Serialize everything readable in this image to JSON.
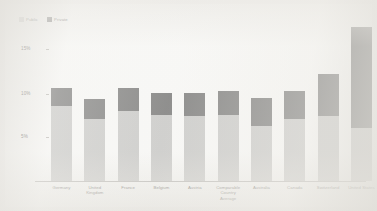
{
  "chart_data": {
    "type": "bar",
    "subtype": "stacked-vertical",
    "title": "",
    "xlabel": "",
    "ylabel": "",
    "ylim": [
      0,
      18
    ],
    "grid": false,
    "legend_position": "top-left",
    "ytick_labels": [
      "15%",
      "10%",
      "5%"
    ],
    "ytick_values": [
      15,
      10,
      5
    ],
    "categories": [
      "Germany",
      "United Kingdom",
      "France",
      "Belgium",
      "Austria",
      "Comparable Country Average",
      "Australia",
      "Canada",
      "Switzerland",
      "United States"
    ],
    "series": [
      {
        "name": "Public",
        "color": "#c4c4c2",
        "values": [
          8.5,
          7.1,
          7.9,
          7.5,
          7.4,
          7.5,
          6.3,
          7.1,
          7.4,
          6.0
        ]
      },
      {
        "name": "Private",
        "color": "#6f6f6e",
        "values": [
          2.1,
          2.2,
          2.7,
          2.5,
          2.6,
          2.7,
          3.1,
          3.1,
          4.8,
          11.5
        ]
      }
    ],
    "totals": [
      10.6,
      9.3,
      10.6,
      10.0,
      10.0,
      10.2,
      9.4,
      10.2,
      12.2,
      17.5
    ]
  },
  "legend": {
    "items": [
      {
        "label": "Public",
        "color": "#c4c4c2"
      },
      {
        "label": "Private",
        "color": "#6f6f6e"
      }
    ]
  },
  "axis": {
    "ticks": [
      {
        "label": "15%"
      },
      {
        "label": "10%"
      },
      {
        "label": "5%"
      }
    ]
  }
}
